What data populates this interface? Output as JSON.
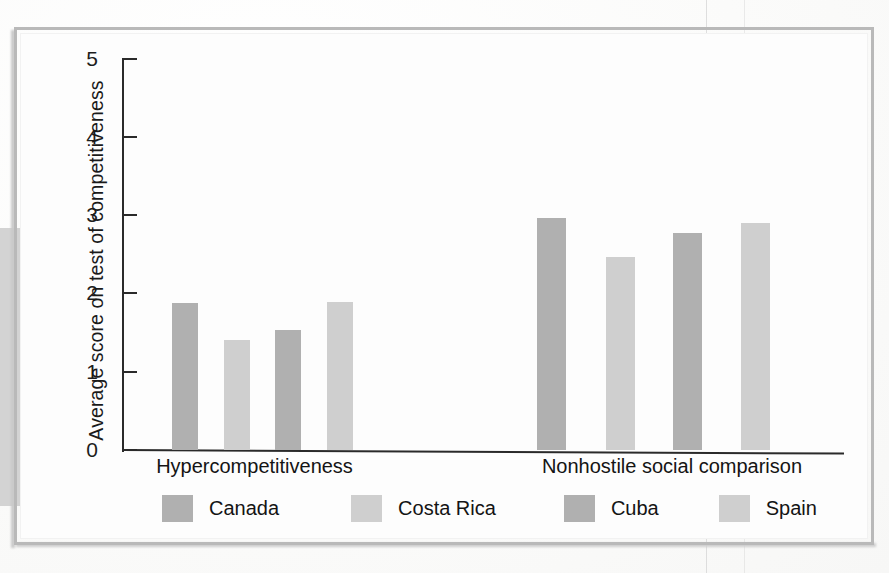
{
  "figure": {
    "y_axis_title": "Average score on test of competitiveness",
    "y_ticks": [
      "5",
      "4",
      "3",
      "2",
      "1",
      "0"
    ],
    "categories": [
      "Hypercompetitiveness",
      "Nonhostile social comparison"
    ],
    "legend": [
      {
        "label": "Canada",
        "color": "#b0b0b0",
        "swatch_name": "legend-swatch-canada"
      },
      {
        "label": "Costa Rica",
        "color": "#cfcfcf",
        "swatch_name": "legend-swatch-costa-rica"
      },
      {
        "label": "Cuba",
        "color": "#b0b0b0",
        "swatch_name": "legend-swatch-cuba"
      },
      {
        "label": "Spain",
        "color": "#cfcfcf",
        "swatch_name": "legend-swatch-spain"
      }
    ]
  },
  "chart_data": {
    "type": "bar",
    "title": "",
    "xlabel": "",
    "ylabel": "Average score on test of competitiveness",
    "ylim": [
      0,
      5
    ],
    "ytick_values": [
      0,
      1,
      2,
      3,
      4,
      5
    ],
    "grid": false,
    "legend_position": "bottom",
    "categories": [
      "Hypercompetitiveness",
      "Nonhostile social comparison"
    ],
    "series": [
      {
        "name": "Canada",
        "values": [
          1.88,
          2.97
        ],
        "color": "#b0b0b0"
      },
      {
        "name": "Costa Rica",
        "values": [
          1.41,
          2.47
        ],
        "color": "#cfcfcf"
      },
      {
        "name": "Cuba",
        "values": [
          1.54,
          2.78
        ],
        "color": "#b0b0b0"
      },
      {
        "name": "Spain",
        "values": [
          1.9,
          2.91
        ],
        "color": "#cfcfcf"
      }
    ],
    "bars": [
      {
        "group": "Hypercompetitiveness",
        "series": "Canada",
        "value": 1.88,
        "x": 172,
        "width": 26,
        "color": "#b0b0b0"
      },
      {
        "group": "Hypercompetitiveness",
        "series": "Costa Rica",
        "value": 1.41,
        "x": 224,
        "width": 26,
        "color": "#cfcfcf"
      },
      {
        "group": "Hypercompetitiveness",
        "series": "Cuba",
        "value": 1.54,
        "x": 275,
        "width": 26,
        "color": "#b0b0b0"
      },
      {
        "group": "Hypercompetitiveness",
        "series": "Spain",
        "value": 1.9,
        "x": 327,
        "width": 26,
        "color": "#cfcfcf"
      },
      {
        "group": "Nonhostile social comparison",
        "series": "Canada",
        "value": 2.97,
        "x": 537,
        "width": 29,
        "color": "#b0b0b0"
      },
      {
        "group": "Nonhostile social comparison",
        "series": "Costa Rica",
        "value": 2.47,
        "x": 606,
        "width": 29,
        "color": "#cfcfcf"
      },
      {
        "group": "Nonhostile social comparison",
        "series": "Cuba",
        "value": 2.78,
        "x": 673,
        "width": 29,
        "color": "#b0b0b0"
      },
      {
        "group": "Nonhostile social comparison",
        "series": "Spain",
        "value": 2.91,
        "x": 741,
        "width": 29,
        "color": "#cfcfcf"
      }
    ]
  }
}
